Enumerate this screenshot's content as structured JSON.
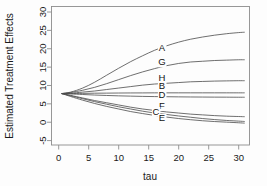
{
  "chart_data": {
    "type": "line",
    "title": "",
    "xlabel": "tau",
    "ylabel": "Estimated Treatment Effects",
    "xlim": [
      -1.2,
      31.8
    ],
    "ylim": [
      -6.2,
      31.5
    ],
    "xticks": [
      0,
      5,
      10,
      15,
      20,
      25,
      30
    ],
    "xticklabels": [
      "0",
      "5",
      "10",
      "15",
      "20",
      "25",
      "30"
    ],
    "yticks": [
      -5,
      0,
      5,
      10,
      15,
      20,
      25,
      30
    ],
    "yticklabels": [
      "-5",
      "0",
      "5",
      "10",
      "15",
      "20",
      "25",
      "30"
    ],
    "grid": false,
    "legend": "inline-curve-labels",
    "x": [
      0.5,
      2,
      4,
      6,
      8,
      10,
      12,
      14,
      16,
      18,
      20,
      22,
      24,
      26,
      28,
      30,
      31
    ],
    "series": [
      {
        "name": "A",
        "label": "A",
        "label_x": 17.2,
        "label_y": 19.4,
        "values": [
          7.8,
          8.2,
          9.3,
          10.9,
          12.8,
          14.7,
          16.5,
          18.1,
          19.6,
          20.8,
          21.8,
          22.6,
          23.2,
          23.7,
          24.1,
          24.4,
          24.5
        ]
      },
      {
        "name": "G",
        "label": "G",
        "label_x": 17.2,
        "label_y": 15.5,
        "values": [
          7.8,
          8.1,
          8.7,
          9.5,
          10.5,
          11.6,
          12.7,
          13.7,
          14.6,
          15.4,
          16.0,
          16.4,
          16.6,
          16.8,
          16.9,
          17.0,
          17.0
        ]
      },
      {
        "name": "H",
        "label": "H",
        "label_x": 17.2,
        "label_y": 11.3,
        "values": [
          7.8,
          7.9,
          8.2,
          8.5,
          8.9,
          9.3,
          9.7,
          10.1,
          10.4,
          10.6,
          10.8,
          11.0,
          11.1,
          11.2,
          11.25,
          11.3,
          11.3
        ]
      },
      {
        "name": "B",
        "label": "B",
        "label_x": 17.2,
        "label_y": 9.0,
        "values": [
          7.8,
          7.8,
          7.85,
          7.9,
          7.92,
          7.95,
          7.97,
          7.98,
          8.0,
          8.0,
          8.0,
          8.0,
          8.0,
          8.0,
          8.0,
          8.0,
          8.0
        ]
      },
      {
        "name": "D",
        "label": "D",
        "label_x": 17.2,
        "label_y": 6.6,
        "values": [
          7.8,
          7.7,
          7.55,
          7.4,
          7.28,
          7.18,
          7.1,
          7.03,
          6.98,
          6.94,
          6.9,
          6.87,
          6.85,
          6.83,
          6.82,
          6.8,
          6.8
        ]
      },
      {
        "name": "F",
        "label": "F",
        "label_x": 17.2,
        "label_y": 3.6,
        "values": [
          7.8,
          7.3,
          6.6,
          5.9,
          5.3,
          4.7,
          4.1,
          3.6,
          3.2,
          2.8,
          2.5,
          2.2,
          2.0,
          1.8,
          1.65,
          1.55,
          1.5
        ]
      },
      {
        "name": "C",
        "label": "C",
        "label_x": 16.2,
        "label_y": 2.1,
        "values": [
          7.8,
          7.2,
          6.4,
          5.6,
          4.9,
          4.2,
          3.6,
          3.0,
          2.5,
          2.1,
          1.7,
          1.35,
          1.0,
          0.72,
          0.48,
          0.3,
          0.2
        ]
      },
      {
        "name": "E",
        "label": "E",
        "label_x": 17.2,
        "label_y": 0.2,
        "values": [
          7.8,
          7.0,
          6.0,
          5.1,
          4.3,
          3.6,
          2.9,
          2.35,
          1.85,
          1.4,
          1.0,
          0.68,
          0.4,
          0.18,
          0.02,
          -0.15,
          -0.25
        ]
      }
    ]
  },
  "axis": {
    "xlabel": "tau",
    "ylabel": "Estimated Treatment Effects"
  }
}
